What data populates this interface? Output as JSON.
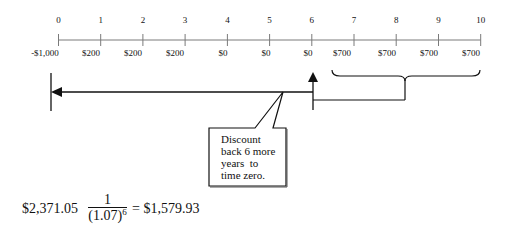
{
  "timeline": {
    "periods": [
      "0",
      "1",
      "2",
      "3",
      "4",
      "5",
      "6",
      "7",
      "8",
      "9",
      "10"
    ],
    "cash_flows": [
      "-$1,000",
      "$200",
      "$200",
      "$200",
      "$0",
      "$0",
      "$0",
      "$700",
      "$700",
      "$700",
      "$700"
    ]
  },
  "callout": {
    "lines": [
      "Discount",
      "back 6 more",
      "years  to",
      "time zero."
    ]
  },
  "formula": {
    "amount": "$2,371.05",
    "numerator": "1",
    "denominator_base": "(1.07)",
    "exponent": "6",
    "equals": "=",
    "result": "$1,579.93"
  },
  "colors": {
    "axis": "#7a7a7a",
    "ink": "#111111"
  }
}
